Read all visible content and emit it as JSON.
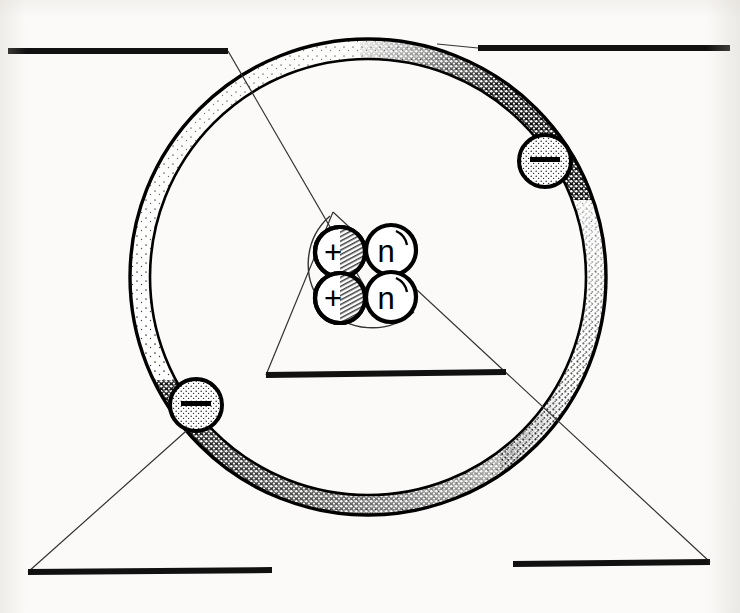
{
  "diagram": {
    "background_color": "#fbfaf8",
    "ink_color": "#111111",
    "style": "hand-drawn pen and ink scan"
  },
  "nucleus": {
    "label": "nucleus",
    "center": {
      "x": 367,
      "y": 273
    },
    "enclosure_radius": 63,
    "particles": [
      {
        "name": "proton",
        "symbol": "+",
        "cx": 340,
        "cy": 252,
        "r": 25,
        "shaded": true
      },
      {
        "name": "neutron",
        "symbol": "n",
        "cx": 391,
        "cy": 250,
        "r": 25,
        "shaded": false
      },
      {
        "name": "proton",
        "symbol": "+",
        "cx": 340,
        "cy": 298,
        "r": 25,
        "shaded": true
      },
      {
        "name": "neutron",
        "symbol": "n",
        "cx": 391,
        "cy": 297,
        "r": 25,
        "shaded": false
      }
    ],
    "proton_count": 2,
    "neutron_count": 2
  },
  "orbit": {
    "label": "electron shell",
    "center": {
      "x": 368,
      "y": 277
    },
    "outer_radius": 238,
    "inner_radius": 218,
    "stroke_width": 3
  },
  "electrons": [
    {
      "name": "electron-upper-right",
      "symbol": "–",
      "cx": 545,
      "cy": 161,
      "r": 26
    },
    {
      "name": "electron-lower-left",
      "symbol": "–",
      "cx": 196,
      "cy": 405,
      "r": 26
    }
  ],
  "answer_lines": [
    {
      "id": "label-line-top-left",
      "value": "",
      "x1": 8,
      "y1": 51,
      "x2": 228,
      "y2": 51
    },
    {
      "id": "label-line-top-right",
      "value": "",
      "x1": 478,
      "y1": 48,
      "x2": 730,
      "y2": 48
    },
    {
      "id": "label-line-middle",
      "value": "",
      "x1": 266,
      "y1": 375,
      "x2": 506,
      "y2": 372
    },
    {
      "id": "label-line-bottom-left",
      "value": "",
      "x1": 28,
      "y1": 572,
      "x2": 272,
      "y2": 570
    },
    {
      "id": "label-line-bottom-right",
      "value": "",
      "x1": 513,
      "y1": 564,
      "x2": 710,
      "y2": 562
    }
  ],
  "leader_lines": [
    {
      "id": "leader-top-left-to-nucleus",
      "from": "label-line-top-left",
      "to": "nucleus",
      "x1": 228,
      "y1": 51,
      "x2": 382,
      "y2": 317
    },
    {
      "id": "leader-top-right-to-orbit",
      "from": "label-line-top-right",
      "to": "orbit",
      "x1": 478,
      "y1": 48,
      "x2": 440,
      "y2": 44
    },
    {
      "id": "leader-bottom-left-to-electron",
      "from": "label-line-bottom-left",
      "to": "electron-lower-left",
      "x1": 28,
      "y1": 572,
      "x2": 194,
      "y2": 424
    },
    {
      "id": "leader-bottom-right-to-nucleus",
      "from": "label-line-bottom-right",
      "to": "nucleus",
      "x1": 710,
      "y1": 562,
      "x2": 333,
      "y2": 212
    },
    {
      "id": "leader-middle-left-edge",
      "from": "label-line-middle",
      "to": "nucleus",
      "x1": 266,
      "y1": 375,
      "x2": 333,
      "y2": 212
    }
  ]
}
